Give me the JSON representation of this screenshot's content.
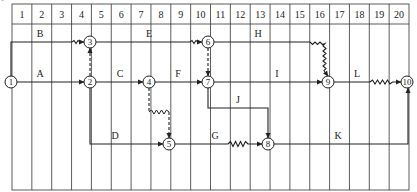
{
  "corner_mark": "°",
  "grid": {
    "columns": [
      "1",
      "2",
      "3",
      "4",
      "5",
      "6",
      "7",
      "8",
      "9",
      "10",
      "11",
      "12",
      "13",
      "14",
      "15",
      "16",
      "17",
      "18",
      "19",
      "20"
    ]
  },
  "nodes": [
    {
      "id": "1",
      "label": "1"
    },
    {
      "id": "2",
      "label": "2"
    },
    {
      "id": "3",
      "label": "3"
    },
    {
      "id": "4",
      "label": "4"
    },
    {
      "id": "5",
      "label": "5"
    },
    {
      "id": "6",
      "label": "6"
    },
    {
      "id": "7",
      "label": "7"
    },
    {
      "id": "8",
      "label": "8"
    },
    {
      "id": "9",
      "label": "9"
    },
    {
      "id": "10",
      "label": "10"
    }
  ],
  "activities": [
    {
      "name": "A",
      "from": "1",
      "to": "2"
    },
    {
      "name": "B",
      "from": "1",
      "to": "3"
    },
    {
      "name": "C",
      "from": "2",
      "to": "4"
    },
    {
      "name": "D",
      "from": "2",
      "to": "5"
    },
    {
      "name": "E",
      "from": "3",
      "to": "6"
    },
    {
      "name": "F",
      "from": "4",
      "to": "7"
    },
    {
      "name": "G",
      "from": "5",
      "to": "8"
    },
    {
      "name": "H",
      "from": "6",
      "to": "9"
    },
    {
      "name": "I",
      "from": "7",
      "to": "9"
    },
    {
      "name": "J",
      "from": "7",
      "to": "8"
    },
    {
      "name": "K",
      "from": "8",
      "to": "10"
    },
    {
      "name": "L",
      "from": "9",
      "to": "10"
    }
  ],
  "dummies": [
    {
      "from": "2",
      "to": "3"
    },
    {
      "from": "6",
      "to": "7"
    },
    {
      "from": "4",
      "to": "5"
    }
  ]
}
